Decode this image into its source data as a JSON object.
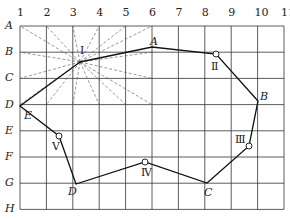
{
  "grid": {
    "columns": [
      "1",
      "2",
      "3",
      "4",
      "5",
      "6",
      "7",
      "8",
      "9",
      "10",
      "11"
    ],
    "rows": [
      "A",
      "B",
      "C",
      "D",
      "E",
      "F",
      "G",
      "H"
    ],
    "x0": 20,
    "dx": 26.4,
    "y0": 26,
    "dy": 26.2,
    "line_color": "#333333"
  },
  "path": {
    "points": [
      {
        "id": "I-start",
        "x": 80,
        "y": 62
      },
      {
        "id": "A",
        "x": 152,
        "y": 47
      },
      {
        "id": "II",
        "x": 216,
        "y": 54
      },
      {
        "id": "B",
        "x": 258,
        "y": 101
      },
      {
        "id": "III",
        "x": 249,
        "y": 146
      },
      {
        "id": "C",
        "x": 207,
        "y": 183
      },
      {
        "id": "IV",
        "x": 145,
        "y": 162
      },
      {
        "id": "D",
        "x": 76,
        "y": 184
      },
      {
        "id": "V",
        "x": 59,
        "y": 136
      },
      {
        "id": "E",
        "x": 20,
        "y": 106
      },
      {
        "id": "I-end",
        "x": 80,
        "y": 62
      }
    ],
    "color": "#111111"
  },
  "stations": [
    {
      "label": "Ⅱ",
      "x": 216,
      "y": 54,
      "lx": 211,
      "ly": 61
    },
    {
      "label": "Ⅲ",
      "x": 249,
      "y": 146,
      "lx": 235,
      "ly": 134
    },
    {
      "label": "Ⅳ",
      "x": 145,
      "y": 162,
      "lx": 141,
      "ly": 167
    },
    {
      "label": "Ⅴ",
      "x": 59,
      "y": 136,
      "lx": 52,
      "ly": 141
    }
  ],
  "point_labels": [
    {
      "label": "A",
      "x": 150,
      "y": 36
    },
    {
      "label": "B",
      "x": 260,
      "y": 91
    },
    {
      "label": "C",
      "x": 204,
      "y": 187
    },
    {
      "label": "D",
      "x": 68,
      "y": 186
    },
    {
      "label": "E",
      "x": 24,
      "y": 110
    }
  ],
  "center": {
    "label": "Ⅰ",
    "x": 80,
    "y": 62,
    "lx": 80,
    "ly": 45
  },
  "rays_count": 16
}
